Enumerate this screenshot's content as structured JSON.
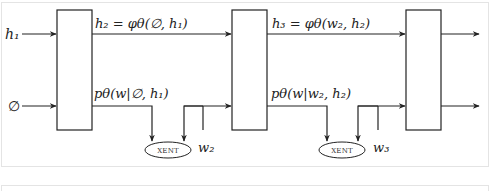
{
  "diagram": {
    "inputs": {
      "h1": "h₁",
      "empty": "∅"
    },
    "edges": {
      "h2_label": "h₂ = φθ(∅, h₁)",
      "p1_label": "pθ(w|∅, h₁)",
      "h3_label": "h₃ = φθ(w₂, h₂)",
      "p2_label": "pθ(w|w₂, h₂)"
    },
    "loss_nodes": [
      {
        "label": "XENT",
        "target": "w₂"
      },
      {
        "label": "XENT",
        "target": "w₃"
      }
    ],
    "targets": {
      "w2": "w₂",
      "w3": "w₃"
    },
    "stroke_color": "#222222",
    "border_color": "#e4e4e4"
  }
}
